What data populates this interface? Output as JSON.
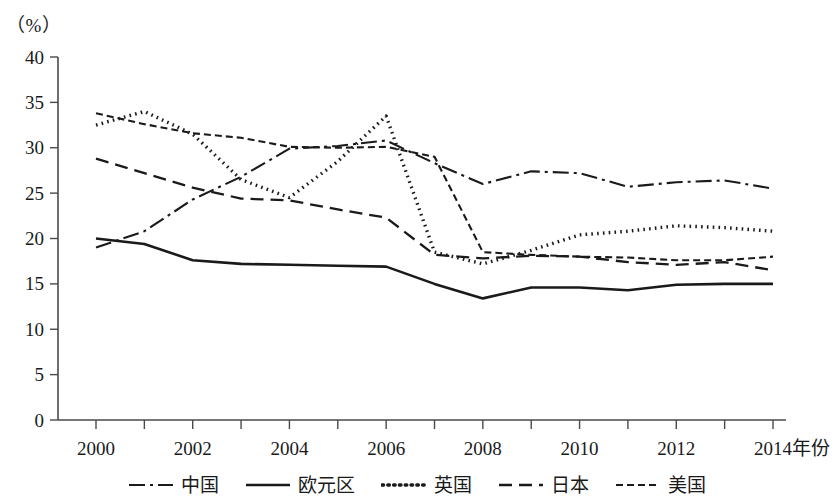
{
  "chart_data": {
    "type": "line",
    "title": "",
    "subtitle": "",
    "xlabel": "年份",
    "ylabel": "（%）",
    "unit_label": "（%）",
    "xlim": [
      2000,
      2014
    ],
    "ylim": [
      0,
      40
    ],
    "y_ticks": [
      0,
      5,
      10,
      15,
      20,
      25,
      30,
      35,
      40
    ],
    "y_tick_labels": [
      "0",
      "5",
      "10",
      "15",
      "20",
      "25",
      "30",
      "35",
      "40"
    ],
    "x": [
      2000,
      2001,
      2002,
      2003,
      2004,
      2005,
      2006,
      2007,
      2008,
      2009,
      2010,
      2011,
      2012,
      2013,
      2014
    ],
    "x_ticks": [
      2000,
      2001,
      2002,
      2003,
      2004,
      2005,
      2006,
      2007,
      2008,
      2009,
      2010,
      2011,
      2012,
      2013,
      2014
    ],
    "x_tick_labels": [
      "2000",
      "",
      "2002",
      "",
      "2004",
      "",
      "2006",
      "",
      "2008",
      "",
      "2010",
      "",
      "2012",
      "",
      "2014"
    ],
    "grid": false,
    "legend_position": "bottom",
    "series": [
      {
        "name": "中国",
        "style": "dash-dot",
        "dash_array": "16,5,3,5",
        "stroke_width": 2.1,
        "values": [
          19.0,
          20.8,
          24.3,
          26.8,
          29.9,
          30.2,
          30.8,
          28.3,
          26.0,
          27.4,
          27.2,
          25.7,
          26.2,
          26.4,
          25.5
        ]
      },
      {
        "name": "欧元区",
        "style": "solid",
        "dash_array": "none",
        "stroke_width": 2.6,
        "values": [
          20.0,
          19.4,
          17.6,
          17.2,
          17.1,
          17.0,
          16.9,
          15.0,
          13.4,
          14.6,
          14.6,
          14.3,
          14.9,
          15.0,
          15.0
        ]
      },
      {
        "name": "英国",
        "style": "dotted",
        "dash_array": "1.6,4.2",
        "stroke_width": 3.4,
        "values": [
          32.5,
          34.0,
          31.5,
          26.5,
          24.5,
          28.5,
          33.5,
          18.5,
          17.2,
          18.7,
          20.4,
          20.8,
          21.4,
          21.2,
          20.8
        ]
      },
      {
        "name": "日本",
        "style": "dashed",
        "dash_array": "13,7",
        "stroke_width": 2.3,
        "values": [
          28.8,
          27.2,
          25.6,
          24.4,
          24.2,
          23.2,
          22.3,
          18.2,
          17.8,
          18.1,
          18.0,
          17.4,
          17.1,
          17.4,
          16.5
        ]
      },
      {
        "name": "美国",
        "style": "fine-dashed",
        "dash_array": "7,4",
        "stroke_width": 2.1,
        "values": [
          33.8,
          32.6,
          31.6,
          31.1,
          30.1,
          30.0,
          30.1,
          29.0,
          18.5,
          18.2,
          18.0,
          17.9,
          17.6,
          17.6,
          18.0
        ]
      }
    ]
  },
  "legend": {
    "items": [
      {
        "label": "中国",
        "style": "dash-dot"
      },
      {
        "label": "欧元区",
        "style": "solid"
      },
      {
        "label": "英国",
        "style": "dotted"
      },
      {
        "label": "日本",
        "style": "dashed"
      },
      {
        "label": "美国",
        "style": "fine-dashed"
      }
    ]
  },
  "colors": {
    "line": "#1a1a1a",
    "axis": "#4a4a4a",
    "background": "#ffffff"
  }
}
